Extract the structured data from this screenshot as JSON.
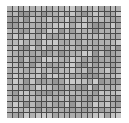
{
  "image": {
    "subject": "gray stone mosaic tile sheet",
    "grid": {
      "rows": 20,
      "cols": 20
    },
    "tile_colors": [
      "#b8b8b8",
      "#a9a9a9",
      "#c4c4c4",
      "#9e9e9e",
      "#b0b0b0",
      "#bcbcbc",
      "#a4a4a4",
      "#c9c9c9",
      "#acacac",
      "#969696"
    ],
    "grout_color": "#4a4a4a",
    "background_color": "#ffffff"
  }
}
